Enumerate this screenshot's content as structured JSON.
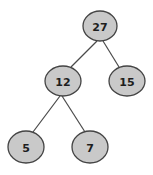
{
  "diagram": {
    "type": "binary-tree",
    "colors": {
      "node_fill": "#c9c9c9",
      "node_stroke": "#444444",
      "edge": "#4a4a4a",
      "text": "#1e1e1e"
    },
    "nodes": [
      {
        "id": "n27",
        "label": "27",
        "cx": 100,
        "cy": 26,
        "rx": 17,
        "ry": 15
      },
      {
        "id": "n12",
        "label": "12",
        "cx": 63,
        "cy": 81,
        "rx": 18,
        "ry": 15
      },
      {
        "id": "n15",
        "label": "15",
        "cx": 127,
        "cy": 81,
        "rx": 18,
        "ry": 15
      },
      {
        "id": "n5",
        "label": "5",
        "cx": 26,
        "cy": 147,
        "rx": 18,
        "ry": 16
      },
      {
        "id": "n7",
        "label": "7",
        "cx": 90,
        "cy": 147,
        "rx": 18,
        "ry": 16
      }
    ],
    "edges": [
      {
        "from": "n27",
        "to": "n12"
      },
      {
        "from": "n27",
        "to": "n15"
      },
      {
        "from": "n12",
        "to": "n5"
      },
      {
        "from": "n12",
        "to": "n7"
      }
    ]
  }
}
